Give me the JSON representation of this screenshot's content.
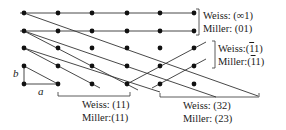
{
  "figure": {
    "type": "lattice-plane-diagram",
    "grid": {
      "columns_x": [
        24,
        58,
        92,
        127,
        160,
        194
      ],
      "rows_y": [
        13,
        31,
        48,
        66,
        84
      ],
      "dot_color": "#111111",
      "line_color": "#333333"
    },
    "axes": {
      "a_label": "a",
      "b_label": "b"
    },
    "labels": {
      "inf1": {
        "weiss": "Weiss: (∞1)",
        "miller": "Miller: (01)"
      },
      "bar11": {
        "weiss_prefix": "Weiss:(",
        "weiss_bar": "1",
        "weiss_suffix": "1)",
        "miller_prefix": "Miller:(",
        "miller_bar": "1",
        "miller_suffix": "1)"
      },
      "l11": {
        "weiss": "Weiss: (11)",
        "miller": "Miller:(11)"
      },
      "l32": {
        "weiss": "Weiss: (32)",
        "miller": "Miller: (23)"
      }
    }
  }
}
